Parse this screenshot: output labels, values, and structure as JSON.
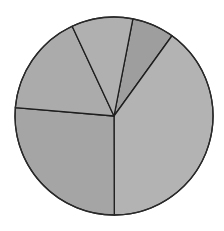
{
  "chart_data": {
    "type": "pie",
    "title": "",
    "legend": [],
    "start_angle_deg_clockwise_from_top": 11,
    "slices": [
      {
        "label": "",
        "value": 6.9,
        "color": "#9e9e9e"
      },
      {
        "label": "",
        "value": 40.0,
        "color": "#b3b3b3"
      },
      {
        "label": "",
        "value": 26.4,
        "color": "#a5a5a5"
      },
      {
        "label": "",
        "value": 16.7,
        "color": "#ababab"
      },
      {
        "label": "",
        "value": 10.0,
        "color": "#b0b0b0"
      }
    ],
    "values": [
      6.9,
      40.0,
      26.4,
      16.7,
      10.0
    ],
    "center": [
      114,
      116
    ],
    "radius": 99
  }
}
